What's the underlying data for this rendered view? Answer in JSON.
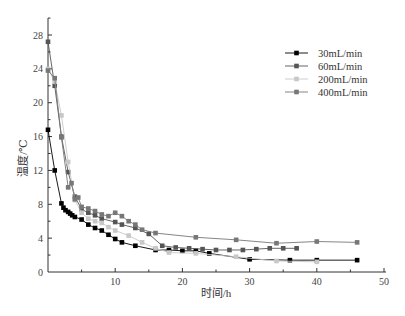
{
  "chart_data": {
    "type": "line",
    "title": "",
    "xlabel": "时间/h",
    "ylabel": "温度/℃",
    "xlim": [
      0,
      50
    ],
    "ylim": [
      0,
      30
    ],
    "x_ticks": [
      10,
      20,
      30,
      40,
      50
    ],
    "y_ticks": [
      0,
      4,
      8,
      12,
      16,
      20,
      24,
      28
    ],
    "grid": false,
    "legend_position": "upper right",
    "series": [
      {
        "name": "30mL/min",
        "color": "#000000",
        "x": [
          0,
          1,
          2,
          2.3,
          2.6,
          3,
          3.3,
          3.6,
          4,
          5,
          6,
          7,
          8,
          9,
          10,
          11,
          13,
          16,
          18,
          20,
          22,
          24,
          30,
          36,
          40,
          46
        ],
        "y": [
          16.8,
          12,
          8.1,
          7.6,
          7.3,
          7.1,
          6.9,
          6.7,
          6.5,
          6.2,
          5.6,
          5.2,
          4.9,
          4.4,
          3.9,
          3.5,
          3.1,
          2.6,
          2.6,
          2.5,
          2.5,
          2.2,
          1.5,
          1.4,
          1.4,
          1.4
        ]
      },
      {
        "name": "60mL/min",
        "color": "#555555",
        "x": [
          0,
          1,
          2,
          3,
          4,
          5,
          6,
          7,
          8,
          10,
          11,
          13,
          15,
          17,
          19,
          21,
          23,
          25,
          27,
          29,
          31,
          33,
          35,
          37
        ],
        "y": [
          27.2,
          22,
          16,
          11.8,
          8.9,
          7.4,
          7.0,
          6.7,
          6.3,
          5.9,
          5.6,
          5.2,
          4.5,
          3.1,
          2.9,
          2.8,
          2.7,
          2.6,
          2.6,
          2.6,
          2.7,
          2.8,
          2.8,
          2.8
        ]
      },
      {
        "name": "200mL/min",
        "color": "#c8c8c8",
        "x": [
          0,
          1,
          2,
          3,
          4,
          5,
          6,
          7,
          8,
          9,
          10,
          12,
          14,
          16,
          18,
          22,
          28,
          34,
          40
        ],
        "y": [
          24,
          22.5,
          18.5,
          13,
          8.5,
          7.0,
          6.3,
          6.0,
          5.8,
          5.3,
          4.9,
          4.3,
          3.5,
          2.8,
          2.3,
          2.2,
          1.8,
          1.3,
          1.2
        ]
      },
      {
        "name": "400mL/min",
        "color": "#777777",
        "x": [
          0,
          1,
          2,
          3,
          3.5,
          4,
          4.5,
          5,
          6,
          7,
          8,
          9,
          10,
          11,
          12,
          13,
          14,
          16,
          22,
          28,
          34,
          40,
          46
        ],
        "y": [
          23.8,
          22.9,
          15.9,
          10,
          10.5,
          8.6,
          8.8,
          7.7,
          7.5,
          7.2,
          6.8,
          6.6,
          7.0,
          6.6,
          6.0,
          5.6,
          5.0,
          4.6,
          4.1,
          3.8,
          3.4,
          3.6,
          3.5
        ]
      }
    ]
  },
  "legend": {
    "items": [
      {
        "label": "30mL/min",
        "color": "#000000"
      },
      {
        "label": "60mL/min",
        "color": "#555555"
      },
      {
        "label": "200mL/min",
        "color": "#c8c8c8"
      },
      {
        "label": "400mL/min",
        "color": "#777777"
      }
    ]
  }
}
